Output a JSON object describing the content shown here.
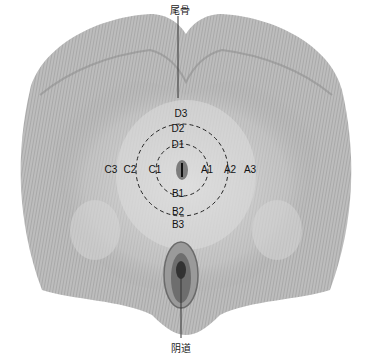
{
  "diagram": {
    "top_label": "尾骨",
    "bottom_label": "阴道",
    "markers": [
      {
        "id": "D3",
        "x": 185,
        "y": 114
      },
      {
        "id": "D2",
        "x": 178,
        "y": 130
      },
      {
        "id": "D1",
        "x": 179,
        "y": 146
      },
      {
        "id": "C3",
        "x": 109,
        "y": 170
      },
      {
        "id": "C2",
        "x": 130,
        "y": 170
      },
      {
        "id": "C1",
        "x": 155,
        "y": 170
      },
      {
        "id": "A1",
        "x": 205,
        "y": 170
      },
      {
        "id": "A2",
        "x": 228,
        "y": 170
      },
      {
        "id": "A3",
        "x": 250,
        "y": 170
      },
      {
        "id": "B1",
        "x": 179,
        "y": 194
      },
      {
        "id": "B2",
        "x": 179,
        "y": 213
      },
      {
        "id": "B3",
        "x": 179,
        "y": 226
      }
    ],
    "colors": {
      "tissue": "#b8b8b8",
      "tissue_dark": "#8a8a8a",
      "label": "#111111",
      "background": "#ffffff"
    }
  }
}
